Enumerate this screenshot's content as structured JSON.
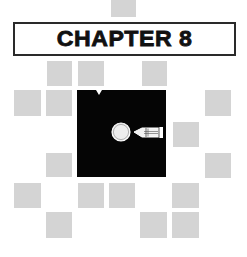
{
  "header": {
    "title": "CHAPTER 8"
  },
  "colors": {
    "background": "#ffffff",
    "tile": "#d4d4d4",
    "panel": "#050505",
    "border": "#2a2a2a",
    "text": "#111111"
  },
  "illustration": {
    "icons": [
      "ball-icon",
      "bullet-icon"
    ]
  },
  "tiles": [
    {
      "x": 111,
      "y": 0,
      "w": 25,
      "h": 17
    },
    {
      "x": 47,
      "y": 61,
      "w": 25,
      "h": 25
    },
    {
      "x": 78,
      "y": 61,
      "w": 26,
      "h": 25
    },
    {
      "x": 142,
      "y": 61,
      "w": 25,
      "h": 25
    },
    {
      "x": 14,
      "y": 90,
      "w": 27,
      "h": 26
    },
    {
      "x": 46,
      "y": 90,
      "w": 26,
      "h": 26
    },
    {
      "x": 205,
      "y": 90,
      "w": 26,
      "h": 26
    },
    {
      "x": 173,
      "y": 122,
      "w": 26,
      "h": 25
    },
    {
      "x": 46,
      "y": 153,
      "w": 26,
      "h": 24
    },
    {
      "x": 205,
      "y": 153,
      "w": 26,
      "h": 25
    },
    {
      "x": 14,
      "y": 183,
      "w": 27,
      "h": 25
    },
    {
      "x": 78,
      "y": 183,
      "w": 26,
      "h": 25
    },
    {
      "x": 109,
      "y": 183,
      "w": 26,
      "h": 25
    },
    {
      "x": 172,
      "y": 183,
      "w": 27,
      "h": 25
    },
    {
      "x": 46,
      "y": 212,
      "w": 26,
      "h": 26
    },
    {
      "x": 140,
      "y": 212,
      "w": 27,
      "h": 26
    },
    {
      "x": 172,
      "y": 212,
      "w": 27,
      "h": 26
    }
  ]
}
